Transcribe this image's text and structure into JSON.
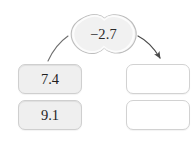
{
  "canvas": {
    "width": 196,
    "height": 142,
    "background": "#ffffff"
  },
  "bubble": {
    "name": "value-bubble",
    "value": "−2.7",
    "shape": "cloud-peanut",
    "fill": "#f1f1f1",
    "stroke": "#bdbdbd",
    "text_color": "#2b2b2b"
  },
  "source_tiles": [
    {
      "label": "7.4",
      "fill": "#efefef",
      "stroke": "#cfcfcf"
    },
    {
      "label": "9.1",
      "fill": "#efefef",
      "stroke": "#cfcfcf"
    }
  ],
  "target_tiles": [
    {
      "label": "",
      "fill": "#ffffff",
      "stroke": "#d2d2d2"
    },
    {
      "label": "",
      "fill": "#ffffff",
      "stroke": "#d2d2d2"
    }
  ],
  "connectors": [
    {
      "name": "connector-left",
      "from": "value-bubble",
      "to": "source-tile-0",
      "has_arrowhead": false,
      "stroke": "#6e6e6e"
    },
    {
      "name": "connector-right",
      "from": "value-bubble",
      "to": "target-tile-0",
      "has_arrowhead": true,
      "stroke": "#4a4a4a"
    }
  ]
}
